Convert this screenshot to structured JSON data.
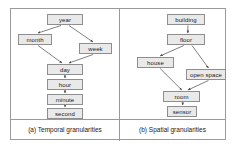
{
  "figure": {
    "panels": [
      {
        "id": "temporal",
        "caption": "(a) Temporal granularities",
        "nodes": [
          {
            "id": "year",
            "label": "year",
            "x": 36,
            "y": 5,
            "w": 36
          },
          {
            "id": "month",
            "label": "month",
            "x": 7,
            "y": 25,
            "w": 34
          },
          {
            "id": "week",
            "label": "week",
            "x": 68,
            "y": 34,
            "w": 33
          },
          {
            "id": "day",
            "label": "day",
            "x": 36,
            "y": 55,
            "w": 36
          },
          {
            "id": "hour",
            "label": "hour",
            "x": 36,
            "y": 70,
            "w": 36
          },
          {
            "id": "minute",
            "label": "minute",
            "x": 36,
            "y": 85,
            "w": 36
          },
          {
            "id": "second",
            "label": "second",
            "x": 36,
            "y": 99,
            "w": 36
          }
        ],
        "edges": [
          {
            "from": "year",
            "to": "month"
          },
          {
            "from": "year",
            "to": "week"
          },
          {
            "from": "month",
            "to": "day"
          },
          {
            "from": "week",
            "to": "day"
          },
          {
            "from": "day",
            "to": "hour"
          },
          {
            "from": "hour",
            "to": "minute"
          },
          {
            "from": "minute",
            "to": "second"
          }
        ]
      },
      {
        "id": "spatial",
        "caption": "(b) Spatial granularities",
        "nodes": [
          {
            "id": "building",
            "label": "building",
            "x": 47,
            "y": 5,
            "w": 38
          },
          {
            "id": "floor",
            "label": "floor",
            "x": 47,
            "y": 25,
            "w": 38
          },
          {
            "id": "house",
            "label": "house",
            "x": 17,
            "y": 48,
            "w": 37
          },
          {
            "id": "open-space",
            "label": "open space",
            "x": 66,
            "y": 60,
            "w": 40
          },
          {
            "id": "room",
            "label": "room",
            "x": 43,
            "y": 82,
            "w": 37
          },
          {
            "id": "sensor",
            "label": "sensor",
            "x": 47,
            "y": 97,
            "w": 30
          }
        ],
        "edges": [
          {
            "from": "building",
            "to": "floor"
          },
          {
            "from": "floor",
            "to": "house"
          },
          {
            "from": "floor",
            "to": "open-space"
          },
          {
            "from": "house",
            "to": "room"
          },
          {
            "from": "open-space",
            "to": "room"
          },
          {
            "from": "room",
            "to": "sensor"
          }
        ]
      }
    ]
  },
  "colors": {
    "node_fill": "#e9e9e9",
    "node_border": "#8e8e8e",
    "frame_border": "#9a9a9a",
    "edge": "#4a4a4a",
    "background": "#ffffff"
  }
}
